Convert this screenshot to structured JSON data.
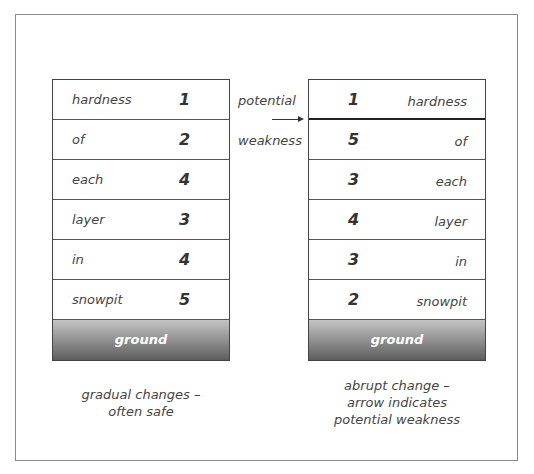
{
  "diagram": {
    "left_pit": {
      "layers": [
        {
          "label": "hardness",
          "value": "1"
        },
        {
          "label": "of",
          "value": "2"
        },
        {
          "label": "each",
          "value": "4"
        },
        {
          "label": "layer",
          "value": "3"
        },
        {
          "label": "in",
          "value": "4"
        },
        {
          "label": "snowpit",
          "value": "5"
        }
      ],
      "ground": "ground",
      "caption_line1": "gradual changes –",
      "caption_line2": "often safe"
    },
    "right_pit": {
      "layers": [
        {
          "label": "hardness",
          "value": "1"
        },
        {
          "label": "of",
          "value": "5"
        },
        {
          "label": "each",
          "value": "3"
        },
        {
          "label": "layer",
          "value": "4"
        },
        {
          "label": "in",
          "value": "3"
        },
        {
          "label": "snowpit",
          "value": "2"
        }
      ],
      "ground": "ground",
      "caption_line1": "abrupt change –",
      "caption_line2": "arrow indicates",
      "caption_line3": "potential weakness"
    },
    "arrow_label_top": "potential",
    "arrow_label_bottom": "weakness",
    "colors": {
      "frame": "#8a8a8a",
      "ground_top": "#c4c4c4",
      "ground_bottom": "#5e5e5e"
    }
  }
}
